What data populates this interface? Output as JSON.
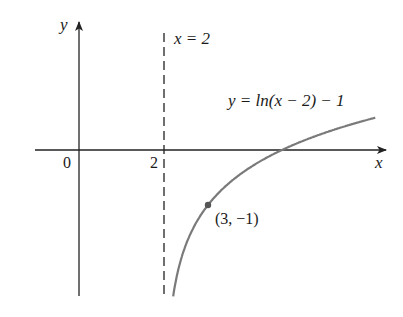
{
  "chart_data": {
    "type": "line",
    "title": "",
    "function": "y = ln(x - 2) - 1",
    "xlabel": "x",
    "ylabel": "y",
    "x_ticks": [
      "0",
      "2"
    ],
    "asymptote": {
      "label": "x = 2",
      "x": 2,
      "style": "dashed"
    },
    "curve_label": "y = ln(x − 2) − 1",
    "highlighted_point": {
      "label": "(3, −1)",
      "x": 3,
      "y": -1
    },
    "x_intercept": 4.718,
    "xlim": [
      -1,
      7.3
    ],
    "ylim": [
      -2.65,
      2.6
    ],
    "series": [
      {
        "name": "y = ln(x - 2) - 1",
        "x": [
          2.19,
          2.3,
          2.5,
          3,
          3.5,
          4,
          4.718,
          5.5,
          6.2,
          6.9
        ],
        "y": [
          -2.66,
          -2.2,
          -1.69,
          -1.0,
          -0.59,
          -0.31,
          0.0,
          0.25,
          0.44,
          0.59
        ]
      }
    ],
    "grid": false,
    "colors": {
      "curve": "#7a7a7a",
      "axes": "#222222",
      "point": "#555555"
    }
  },
  "labels": {
    "y_axis": "y",
    "x_axis": "x",
    "origin": "0",
    "tick_2": "2",
    "asymptote": "x = 2",
    "curve": "y = ln(x − 2) − 1",
    "point": "(3, −1)"
  }
}
